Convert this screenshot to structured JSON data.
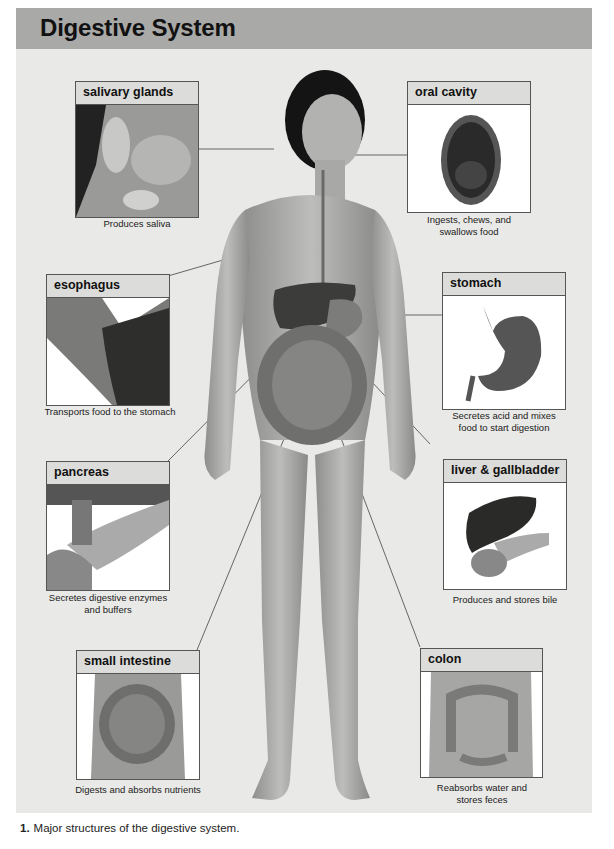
{
  "title": "Digestive System",
  "organs": [
    {
      "id": "salivary-glands",
      "label": "salivary glands",
      "caption": "Produces saliva"
    },
    {
      "id": "oral-cavity",
      "label": "oral cavity",
      "caption": "Ingests, chews, and swallows food"
    },
    {
      "id": "esophagus",
      "label": "esophagus",
      "caption": "Transports food to the stomach"
    },
    {
      "id": "stomach",
      "label": "stomach",
      "caption": "Secretes acid and mixes food to start digestion"
    },
    {
      "id": "pancreas",
      "label": "pancreas",
      "caption": "Secretes digestive enzymes and buffers"
    },
    {
      "id": "liver-gallbladder",
      "label": "liver & gallbladder",
      "caption": "Produces and stores bile"
    },
    {
      "id": "small-intestine",
      "label": "small intestine",
      "caption": "Digests and absorbs nutrients"
    },
    {
      "id": "colon",
      "label": "colon",
      "caption": "Reabsorbs water and stores feces"
    }
  ],
  "figure_caption": {
    "number": "1.",
    "text": "Major structures of the digestive system."
  },
  "colors": {
    "title_bar": "#a9a9a7",
    "panel_bg": "#e9e9e7",
    "box_header": "#dcdcda",
    "border": "#555555"
  }
}
